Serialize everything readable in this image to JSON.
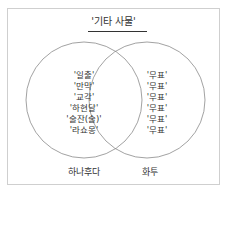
{
  "diagram": {
    "title": "'기타 사물'",
    "left_set": {
      "label": "하나후다",
      "items": [
        "'일출'",
        "'만막'",
        "'교각'",
        "'하현달'",
        "'술잔(술)'",
        "'라쇼몽'"
      ]
    },
    "right_set": {
      "label": "화투",
      "items": [
        "'무표'",
        "'무표'",
        "'무표'",
        "'무표'",
        "'무표'",
        "'무표'"
      ]
    },
    "colors": {
      "circle_stroke": "#8a8a8a",
      "frame_border": "#cfcfcf",
      "text": "#333333"
    }
  }
}
